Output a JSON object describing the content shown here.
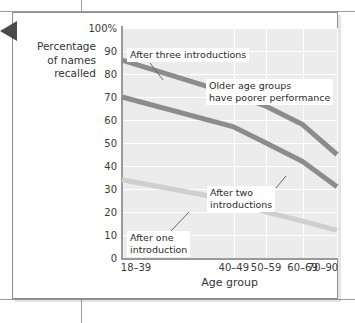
{
  "figure": {
    "pointer_marker": "left-pointing-triangle"
  },
  "chart_data": {
    "type": "line",
    "title": "",
    "xlabel": "Age group",
    "ylabel": "Percentage\nof names\nrecalled",
    "ylabel_lines": [
      "Percentage",
      "of names",
      "recalled"
    ],
    "categories": [
      "18–39",
      "40–49",
      "50–59",
      "60–69",
      "70–90"
    ],
    "category_positions": [
      0,
      0.52,
      0.67,
      0.84,
      1.0
    ],
    "ylim": [
      0,
      100
    ],
    "ytick_labels": [
      "0",
      "10",
      "20",
      "30",
      "40",
      "50",
      "60",
      "70",
      "80",
      "90",
      "100%"
    ],
    "ytick_values": [
      0,
      10,
      20,
      30,
      40,
      50,
      60,
      70,
      80,
      90,
      100
    ],
    "grid": true,
    "legend": "none",
    "series": [
      {
        "name": "After three introductions",
        "color": "#8c8c8c",
        "values": [
          86,
          71,
          66,
          58,
          45
        ]
      },
      {
        "name": "After two introductions",
        "color": "#8c8c8c",
        "values": [
          70,
          57,
          50,
          42,
          31
        ]
      },
      {
        "name": "After one introduction",
        "color": "#cfcfcf",
        "values": [
          34,
          25,
          20,
          16,
          12
        ]
      }
    ],
    "annotations": [
      {
        "id": "after-three-introductions",
        "lines": [
          "After three introductions"
        ],
        "box_x": 127,
        "box_y": 48,
        "leader": {
          "x1": 150,
          "y1": 63,
          "x2": 163,
          "y2": 80
        }
      },
      {
        "id": "older-age-groups",
        "lines": [
          "Older age groups",
          "have poorer performance"
        ],
        "box_x": 206,
        "box_y": 79,
        "leader": null
      },
      {
        "id": "after-two-introductions",
        "lines": [
          "After two",
          "introductions"
        ],
        "box_x": 207,
        "box_y": 186,
        "leader": {
          "x1": 276,
          "y1": 188,
          "x2": 286,
          "y2": 176
        }
      },
      {
        "id": "after-one-introduction",
        "lines": [
          "After one",
          "introduction"
        ],
        "box_x": 127,
        "box_y": 231,
        "leader": {
          "x1": 170,
          "y1": 232,
          "x2": 189,
          "y2": 212
        }
      }
    ]
  }
}
